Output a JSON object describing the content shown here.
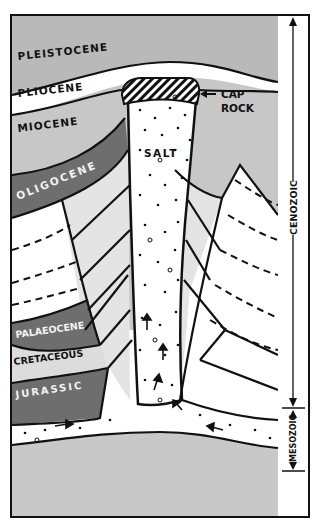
{
  "diagram": {
    "colors": {
      "pleistocene": "#b9b9b9",
      "pliocene": "#ffffff",
      "miocene": "#c7c7c7",
      "oligocene": "#6e6e6e",
      "eocene_band": "#e4e4e4",
      "palaeocene": "#6e6e6e",
      "cretaceous": "#dcdcdc",
      "jurassic": "#6e6e6e",
      "salt": "#ffffff",
      "basement": "#c8c8c8",
      "line": "#111111"
    },
    "layers": {
      "pleistocene": "PLEISTOCENE",
      "pliocene": "PLIOCENE",
      "miocene": "MIOCENE",
      "oligocene": "OLIGOCENE",
      "palaeocene": "PALAEOCENE",
      "cretaceous": "CRETACEOUS",
      "jurassic": "JURASSIC"
    },
    "features": {
      "salt": "SALT",
      "cap_rock_line1": "CAP",
      "cap_rock_line2": "ROCK"
    },
    "eras": {
      "cenozoic": "CENOZOIC",
      "mesozoic": "MESOZOIC"
    }
  }
}
